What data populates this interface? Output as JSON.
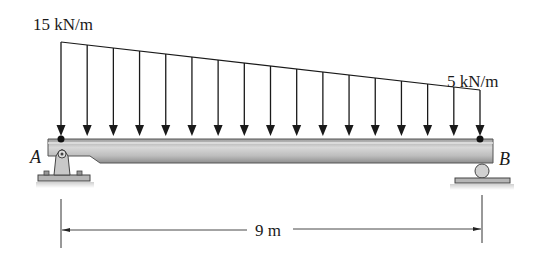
{
  "diagram": {
    "load_left_label": "15 kN/m",
    "load_right_label": "5 kN/m",
    "support_a_label": "A",
    "support_b_label": "B",
    "span_label": "9 m",
    "support_a_type": "pin",
    "support_b_type": "roller",
    "load_arrow_count": 17,
    "colors": {
      "line": "#1a1a1a",
      "beam_fill": "#b8b8b8",
      "beam_highlight": "#d6d6d6",
      "support_fill": "#c4c4c4"
    }
  }
}
